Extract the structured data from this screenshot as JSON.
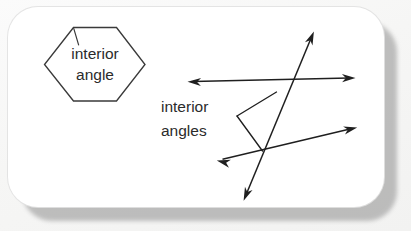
{
  "figure": {
    "background_color": "#f5f5f4",
    "card_color": "#ffffff",
    "shadow_color": "#9b9b9b",
    "ink_color": "#1f1f1f",
    "hexagon": {
      "label_line_1": "interior",
      "label_line_2": "angle",
      "stroke_color": "#3a3a3a",
      "sides": 6
    },
    "transversals": {
      "label_line_1": "interior",
      "label_line_2": "angles",
      "stroke_color": "#1f1f1f",
      "line_count": 3,
      "arrow_heads": 6,
      "leader_count": 2
    }
  }
}
